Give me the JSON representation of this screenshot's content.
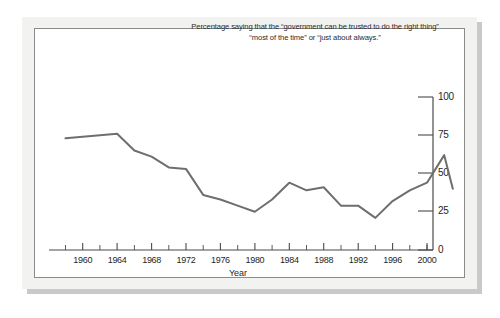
{
  "figure": {
    "title": "Percentage saying that the “government can be trusted to do the right thing” “most of the time” or “just about always.”",
    "frame_color": "#f2f2f0",
    "panel_color": "#ffffff",
    "line_color": "#6e6e6e",
    "axis_color": "#4a4a4a"
  },
  "chart_data": {
    "type": "line",
    "title": "Percentage saying that the “government can be trusted to do the right thing” “most of the time” or “just about always.”",
    "xlabel": "Year",
    "ylabel": "",
    "xlim": [
      1957,
      2004
    ],
    "ylim": [
      0,
      100
    ],
    "grid": false,
    "legend": null,
    "y_ticks": [
      0,
      25,
      50,
      75,
      100
    ],
    "y_tick_labels": [
      "0",
      "25",
      "50",
      "75",
      "100"
    ],
    "y_axis_side": "right",
    "x_ticks": [
      1960,
      1964,
      1968,
      1972,
      1976,
      1980,
      1984,
      1988,
      1992,
      1996,
      2000
    ],
    "x_tick_labels": [
      "1960",
      "1964",
      "1968",
      "1972",
      "1976",
      "1980",
      "1984",
      "1988",
      "1992",
      "1996",
      "2000"
    ],
    "x_minor_tick_interval": 2,
    "series": [
      {
        "name": "Trust in government",
        "color": "#6e6e6e",
        "x": [
          1958,
          1964,
          1966,
          1968,
          1970,
          1972,
          1974,
          1976,
          1978,
          1980,
          1982,
          1984,
          1986,
          1988,
          1990,
          1992,
          1994,
          1996,
          1998,
          2000,
          2002,
          2003
        ],
        "values": [
          73,
          76,
          65,
          61,
          54,
          53,
          36,
          33,
          29,
          25,
          33,
          44,
          39,
          41,
          29,
          29,
          21,
          32,
          39,
          44,
          62,
          40
        ]
      }
    ]
  }
}
